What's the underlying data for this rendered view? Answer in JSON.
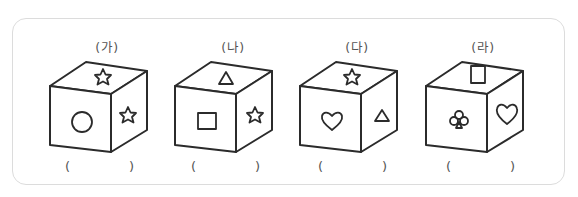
{
  "figure": {
    "frame": {
      "border_color": "#dcdcdc",
      "radius": 14
    },
    "cubes": [
      {
        "label": "(가)",
        "faces": {
          "top": "star",
          "front": "circle",
          "right": "star"
        },
        "answer_open": "(",
        "answer_close": ")"
      },
      {
        "label": "(나)",
        "faces": {
          "top": "triangle",
          "front": "square",
          "right": "star"
        },
        "answer_open": "(",
        "answer_close": ")"
      },
      {
        "label": "(다)",
        "faces": {
          "top": "star",
          "front": "heart",
          "right": "triangle"
        },
        "answer_open": "(",
        "answer_close": ")"
      },
      {
        "label": "(라)",
        "faces": {
          "top": "square",
          "front": "club",
          "right": "heart"
        },
        "answer_open": "(",
        "answer_close": ")"
      }
    ],
    "colors": {
      "line": "#2b2b2b",
      "text": "#555555",
      "background": "#ffffff"
    }
  }
}
